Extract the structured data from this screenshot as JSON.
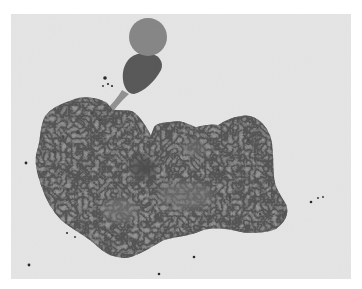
{
  "image": {
    "kind": "micrograph",
    "subject": "amoeboid cell with stalked bulbous extension",
    "width": 362,
    "height": 289
  },
  "colors": {
    "border": "#ffffff",
    "background": "#e3e3e3",
    "cytoplasm": "#8d8d8d",
    "cytoplasm_edge": "#7a7a7a",
    "head": "#7e7e7e",
    "neck": "#4e4e4e",
    "stalk": "#8a8a8a",
    "nucleus": "#3f3f3f",
    "granule": "#4a4a4a",
    "speck": "#2a2a2a"
  },
  "field": {
    "x": 11,
    "y": 14,
    "width": 340,
    "height": 265
  },
  "head": {
    "cx": 148,
    "cy": 37,
    "r": 19
  },
  "nucleus": {
    "cx": 143,
    "cy": 168,
    "rx": 13,
    "ry": 11
  },
  "specks": [
    {
      "x": 105,
      "y": 78,
      "r": 1.8
    },
    {
      "x": 108,
      "y": 84,
      "r": 1.1
    },
    {
      "x": 112,
      "y": 86,
      "r": 1.1
    },
    {
      "x": 103,
      "y": 86,
      "r": 0.9
    },
    {
      "x": 311,
      "y": 202,
      "r": 1.3
    },
    {
      "x": 318,
      "y": 198,
      "r": 0.9
    },
    {
      "x": 323,
      "y": 197,
      "r": 0.9
    },
    {
      "x": 26,
      "y": 163,
      "r": 1.4
    },
    {
      "x": 29,
      "y": 265,
      "r": 1.4
    },
    {
      "x": 67,
      "y": 233,
      "r": 1.0
    },
    {
      "x": 75,
      "y": 237,
      "r": 0.9
    },
    {
      "x": 159,
      "y": 274,
      "r": 1.3
    },
    {
      "x": 194,
      "y": 257,
      "r": 1.3
    }
  ]
}
